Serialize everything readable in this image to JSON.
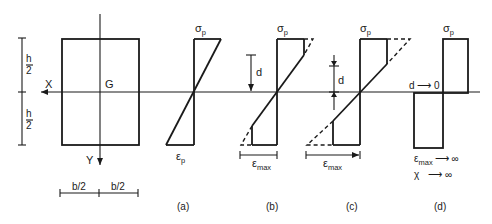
{
  "cross_section": {
    "x_axis_label": "X",
    "y_axis_label": "Y",
    "centroid_label": "G",
    "height_half_top": {
      "num": "h",
      "den": "2"
    },
    "height_half_bottom": {
      "num": "h",
      "den": "2"
    },
    "width_half_left": "b/2",
    "width_half_right": "b/2"
  },
  "panels": [
    {
      "id": "a",
      "caption": "(a)",
      "top_label": "σ",
      "top_sub": "p",
      "bottom_label": "ε",
      "bottom_sub": "p"
    },
    {
      "id": "b",
      "caption": "(b)",
      "top_label": "σ",
      "top_sub": "p",
      "d_label": "d",
      "strain_label": "ε",
      "strain_sub": "max"
    },
    {
      "id": "c",
      "caption": "(c)",
      "top_label": "σ",
      "top_sub": "p",
      "d_label": "d",
      "strain_label": "ε",
      "strain_sub": "max"
    },
    {
      "id": "d",
      "caption": "(d)",
      "top_label": "σ",
      "top_sub": "p",
      "d_limit": "d ⟶ 0",
      "strain_limit_label": "ε",
      "strain_limit_sub": "max",
      "strain_limit_arrow": "⟶ ∞",
      "curvature_label": "χ",
      "curvature_arrow": "⟶ ∞"
    }
  ],
  "colors": {
    "ink": "#1a1a1a",
    "background": "#ffffff"
  }
}
